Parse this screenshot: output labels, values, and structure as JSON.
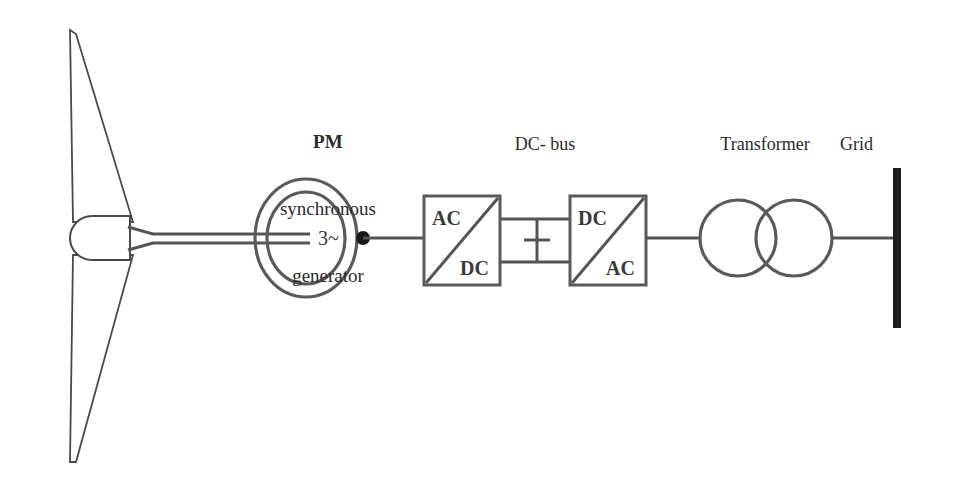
{
  "diagram": {
    "background_color": "#ffffff",
    "line_color": "#555555",
    "text_color": "#2b2b2b",
    "labels": {
      "generator_bold": "PM",
      "generator_line2": "synchronous",
      "generator_line3": "generator",
      "dc_bus": "DC- bus",
      "transformer": "Transformer",
      "grid": "Grid"
    },
    "symbols": {
      "generator_inner_text": "3~",
      "converter1_top": "AC",
      "converter1_bottom": "DC",
      "converter2_top": "DC",
      "converter2_bottom": "AC"
    },
    "components": [
      {
        "name": "wind-turbine-rotor",
        "type": "two-blade rotor with nacelle"
      },
      {
        "name": "pm-synchronous-generator",
        "type": "double circle machine symbol"
      },
      {
        "name": "rectifier",
        "type": "AC/DC converter block"
      },
      {
        "name": "dc-link-capacitor",
        "type": "capacitor across dc bus"
      },
      {
        "name": "inverter",
        "type": "DC/AC converter block"
      },
      {
        "name": "transformer",
        "type": "two overlapping circles"
      },
      {
        "name": "grid-busbar",
        "type": "vertical bus bar"
      }
    ]
  }
}
